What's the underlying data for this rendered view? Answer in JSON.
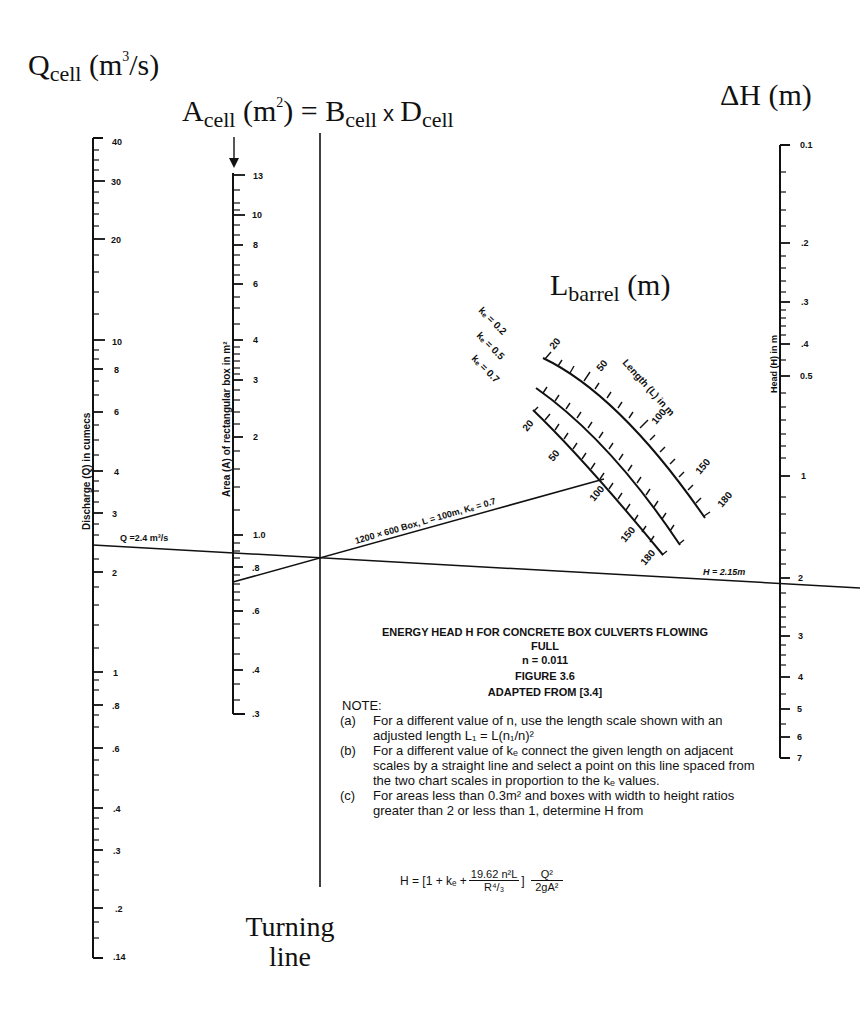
{
  "headings": {
    "q": {
      "main": "Q",
      "sub": "cell",
      "unit_pre": " (m",
      "unit_sup": "3",
      "unit_post": "/s)"
    },
    "a": {
      "main": "A",
      "sub": "cell",
      "unit_pre": " (m",
      "unit_sup": "2",
      "unit_post": ") = ",
      "b": "B",
      "b_sub": "cell",
      "x": " x ",
      "d": "D",
      "d_sub": "cell"
    },
    "dh": {
      "text": "ΔH (m)"
    },
    "lbarrel": {
      "main": "L",
      "sub": "barrel",
      "unit": " (m)"
    },
    "turning_line": [
      "Turning",
      "line"
    ]
  },
  "scales": {
    "discharge": {
      "title": "Discharge (Q) in cumecs",
      "ticks": [
        "40",
        "30",
        "20",
        "10",
        "8",
        "6",
        "4",
        "3",
        "2",
        "1",
        ".8",
        ".6",
        ".4",
        ".3",
        ".2",
        ".14"
      ]
    },
    "area": {
      "title": "Area (A) of rectangular box in m²",
      "ticks": [
        "13",
        "10",
        "8",
        "6",
        "4",
        "3",
        "2",
        "1.0",
        ".8",
        ".6",
        ".4",
        ".3"
      ]
    },
    "head": {
      "title": "Head (H) in m",
      "ticks": [
        "0.1",
        ".2",
        ".3",
        ".4",
        "0.5",
        "1",
        "2",
        "3",
        "4",
        "5",
        "6",
        "7"
      ]
    },
    "length": {
      "title": "Length (L) in m",
      "ke_labels": [
        "kₑ = 0.2",
        "kₑ = 0.5",
        "kₑ = 0.7"
      ],
      "ticks_outer": [
        "20",
        "50",
        "100",
        "150",
        "180"
      ],
      "ticks_inner": [
        "20",
        "50",
        "100",
        "150",
        "180"
      ]
    }
  },
  "annotations": {
    "q_value": "Q =2.4 m³/s",
    "h_value": "H = 2.15m",
    "box_line": "1200 × 600 Box, L = 100m, Kₑ = 0.7"
  },
  "caption": {
    "title": "ENERGY HEAD H FOR CONCRETE BOX CULVERTS FLOWING",
    "title2": "FULL",
    "n": "n = 0.011",
    "figure": "FIGURE 3.6",
    "source": "ADAPTED FROM [3.4]"
  },
  "notes": {
    "heading": "NOTE:",
    "items": [
      {
        "label": "(a)",
        "text": "For a different value of n, use the length scale shown with an adjusted length L₁ = L(n₁/n)²"
      },
      {
        "label": "(b)",
        "text": "For a different value of kₑ connect the given length on adjacent scales by a straight line and select a point on this line spaced from the two chart scales in proportion to the kₑ values."
      },
      {
        "label": "(c)",
        "text": "For areas less than 0.3m² and boxes with width to height ratios greater than 2 or less than 1, determine H from"
      }
    ],
    "formula": {
      "lhs": "H = [1 + kₑ + ",
      "num": "19.62 n²L",
      "den": "R⁴/₃",
      "close": "]",
      "num2": "Q²",
      "den2": "2gA²"
    }
  }
}
